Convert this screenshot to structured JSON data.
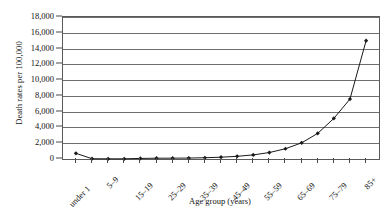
{
  "chart_data": {
    "type": "line",
    "title": "",
    "xlabel": "Age group (years)",
    "ylabel": "Death rates per 100,000",
    "categories": [
      "under 1",
      "1–4",
      "5–9",
      "10–14",
      "15–19",
      "20–24",
      "25–29",
      "30–34",
      "35–39",
      "40–44",
      "45–49",
      "50–54",
      "55–59",
      "60–64",
      "65–69",
      "70–74",
      "75–79",
      "80–84",
      "85+"
    ],
    "visible_tick_labels": [
      "under 1",
      "",
      "5–9",
      "",
      "15–19",
      "",
      "25–29",
      "",
      "35–39",
      "",
      "45–49",
      "",
      "55–59",
      "",
      "65–69",
      "",
      "75–79",
      "",
      "85+"
    ],
    "values": [
      720,
      35,
      20,
      25,
      75,
      100,
      105,
      120,
      160,
      230,
      340,
      520,
      820,
      1300,
      2050,
      3250,
      5150,
      7600,
      15000
    ],
    "ylim": [
      0,
      18000
    ],
    "yticks": [
      0,
      2000,
      4000,
      6000,
      8000,
      10000,
      12000,
      14000,
      16000,
      18000
    ],
    "ytick_labels": [
      "0",
      "2,000",
      "4,000",
      "6,000",
      "8,000",
      "10,000",
      "12,000",
      "14,000",
      "16,000",
      "18,000"
    ],
    "grid": "horizontal",
    "legend": "none",
    "series_color": "#1a1a1a",
    "marker": "diamond",
    "grid_color": "#6e6e6e",
    "border_color": "#5a5a5a"
  }
}
